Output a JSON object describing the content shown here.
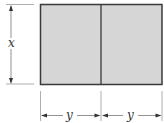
{
  "diagram": {
    "type": "rectangle divided into two equal parts with dimension lines",
    "labels": {
      "height": "x",
      "left_width": "y",
      "right_width": "y"
    },
    "colors": {
      "fill": "#d6d6d6",
      "stroke": "#3a3a3a",
      "dim_line": "#888888"
    }
  }
}
